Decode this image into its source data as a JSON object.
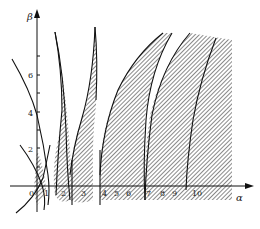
{
  "diagram": {
    "type": "stability-region-plot",
    "x_axis": {
      "label": "α",
      "ticks": [
        {
          "value": "0",
          "x": 31
        },
        {
          "value": "1",
          "x": 44
        },
        {
          "value": "2",
          "x": 60
        },
        {
          "value": "3",
          "x": 81
        },
        {
          "value": "4",
          "x": 102
        },
        {
          "value": "5",
          "x": 115
        },
        {
          "value": "6",
          "x": 128
        },
        {
          "value": "7",
          "x": 147
        },
        {
          "value": "8",
          "x": 162
        },
        {
          "value": "9",
          "x": 174
        },
        {
          "value": "10",
          "x": 196
        }
      ]
    },
    "y_axis": {
      "label": "β",
      "ticks": [
        {
          "value": "2",
          "y": 149
        },
        {
          "value": "4",
          "y": 114
        },
        {
          "value": "6",
          "y": 75
        }
      ]
    },
    "regions": {
      "fill_pattern": "diagonal-hatch",
      "hatch_color": "#555555",
      "boundary_color": "#111111"
    }
  }
}
